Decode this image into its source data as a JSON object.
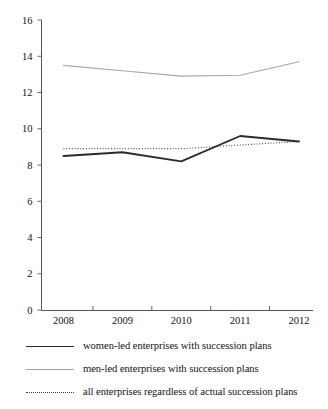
{
  "chart_data": {
    "type": "line",
    "title": "",
    "subtitle": "",
    "xlabel": "",
    "ylabel": "",
    "categories": [
      "2008",
      "2009",
      "2010",
      "2011",
      "2012"
    ],
    "x": [
      2008,
      2009,
      2010,
      2011,
      2012
    ],
    "ylim": [
      0,
      16
    ],
    "yticks": [
      0,
      2,
      4,
      6,
      8,
      10,
      12,
      14,
      16
    ],
    "ytick_labels": [
      "0",
      "2",
      "4",
      "6",
      "8",
      "10",
      "12",
      "14",
      "16"
    ],
    "xtick_labels": [
      "2008",
      "2009",
      "2010",
      "2011",
      "2012"
    ],
    "grid": false,
    "legend_position": "below",
    "series": [
      {
        "name": "women-led enterprises with succession plans",
        "style": "solid",
        "color": "#2b2b2b",
        "width": "thick",
        "values": [
          8.5,
          8.7,
          8.2,
          9.6,
          9.3
        ]
      },
      {
        "name": "men-led enterprises with succession plans",
        "style": "solid",
        "color": "#a8a8a8",
        "width": "thin",
        "values": [
          13.5,
          13.2,
          12.9,
          12.95,
          13.7
        ]
      },
      {
        "name": "all enterprises regardless of actual succession plans",
        "style": "dotted",
        "color": "#3d3d3d",
        "width": "thin",
        "values": [
          8.9,
          8.9,
          8.9,
          9.1,
          9.3
        ]
      }
    ]
  },
  "legend": {
    "items": [
      {
        "label": "women-led enterprises with succession plans",
        "swatch": "solid-thick-dark"
      },
      {
        "label": "men-led enterprises with succession plans",
        "swatch": "solid-thin-gray"
      },
      {
        "label": "all enterprises regardless of actual succession plans",
        "swatch": "dotted-thin-dark"
      }
    ]
  }
}
